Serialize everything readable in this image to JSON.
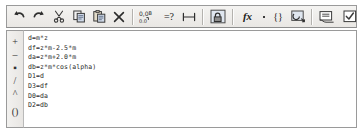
{
  "toolbar": {
    "groups": [
      {
        "name": "edit",
        "buttons": [
          {
            "icon": "undo-icon",
            "label": "Undo"
          },
          {
            "icon": "redo-icon",
            "label": "Redo"
          },
          {
            "icon": "cut-icon",
            "label": "Cut"
          },
          {
            "icon": "copy-icon",
            "label": "Copy"
          },
          {
            "icon": "paste-icon",
            "label": "Paste"
          },
          {
            "icon": "delete-icon",
            "label": "Delete"
          }
        ]
      },
      {
        "name": "format",
        "buttons": [
          {
            "icon": "number-format-icon",
            "label": "Number format"
          },
          {
            "icon": "evaluate-icon",
            "label": "=?"
          },
          {
            "icon": "measure-icon",
            "label": "Measure"
          }
        ]
      },
      {
        "name": "lock",
        "buttons": [
          {
            "icon": "lock-icon",
            "label": "Lock"
          }
        ]
      },
      {
        "name": "insert",
        "buttons": [
          {
            "icon": "function-icon",
            "label": "fx"
          },
          {
            "icon": "operator-dot-icon",
            "label": "."
          },
          {
            "icon": "braces-icon",
            "label": "{}"
          },
          {
            "icon": "unit-icon",
            "label": "Units"
          }
        ]
      },
      {
        "name": "view",
        "buttons": [
          {
            "icon": "note-icon",
            "label": "Note"
          },
          {
            "icon": "check-icon",
            "label": "Check"
          }
        ]
      }
    ],
    "labels": {
      "evaluate": "=?",
      "function": "fx",
      "braces": "{}",
      "dot": "·"
    }
  },
  "sidebar": {
    "operators": [
      {
        "name": "plus-operator",
        "symbol": "+"
      },
      {
        "name": "minus-operator",
        "symbol": "–"
      },
      {
        "name": "multiply-operator",
        "symbol": "▪"
      },
      {
        "name": "divide-operator",
        "symbol": "/"
      },
      {
        "name": "power-operator",
        "symbol": "^"
      },
      {
        "name": "parentheses-operator",
        "symbol": "()"
      }
    ]
  },
  "editor": {
    "content": "d=m*z\ndf=z*m-2.5*m\nda=z*m+2.0*m\ndb=z*m*cos(alpha)\nD1=d\nD3=df\nD0=da\nD2=db",
    "lines": [
      "d=m*z",
      "df=z*m-2.5*m",
      "da=z*m+2.0*m",
      "db=z*m*cos(alpha)",
      "D1=d",
      "D3=df",
      "D0=da",
      "D2=db"
    ]
  },
  "colors": {
    "toolbar_bg": "#eceae7",
    "border": "#9a9a9a",
    "editor_bg": "#ffffff",
    "text": "#2b2b2b"
  }
}
